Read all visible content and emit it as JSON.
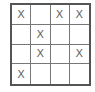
{
  "board": {
    "rows": 4,
    "cols": 4,
    "cells": [
      [
        "X",
        "",
        "X",
        "X"
      ],
      [
        "",
        "X",
        "",
        ""
      ],
      [
        "",
        "X",
        "",
        "X"
      ],
      [
        "X",
        "",
        "",
        ""
      ]
    ]
  }
}
